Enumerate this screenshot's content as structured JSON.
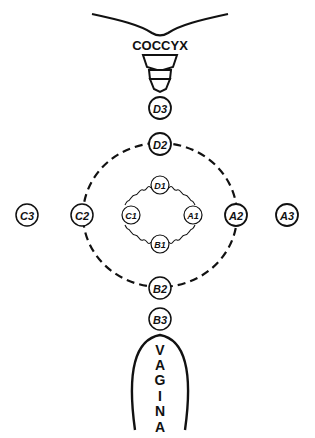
{
  "diagram": {
    "type": "anatomical-schematic",
    "colors": {
      "ink": "#111111",
      "background": "#ffffff"
    },
    "anatomy": {
      "top_label": "COCCYX",
      "bottom_label_letters": [
        "V",
        "A",
        "G",
        "I",
        "N",
        "A"
      ]
    },
    "nodes": [
      {
        "id": "D3",
        "label": "D3",
        "x": 160,
        "y": 108,
        "ring": 3
      },
      {
        "id": "D2",
        "label": "D2",
        "x": 160,
        "y": 144,
        "ring": 2
      },
      {
        "id": "D1",
        "label": "D1",
        "x": 160,
        "y": 185,
        "ring": 1
      },
      {
        "id": "C1",
        "label": "C1",
        "x": 131,
        "y": 215,
        "ring": 1
      },
      {
        "id": "A1",
        "label": "A1",
        "x": 193,
        "y": 215,
        "ring": 1
      },
      {
        "id": "B1",
        "label": "B1",
        "x": 160,
        "y": 244,
        "ring": 1
      },
      {
        "id": "C2",
        "label": "C2",
        "x": 82,
        "y": 215,
        "ring": 2
      },
      {
        "id": "A2",
        "label": "A2",
        "x": 236,
        "y": 215,
        "ring": 2
      },
      {
        "id": "C3",
        "label": "C3",
        "x": 27,
        "y": 215,
        "ring": 3
      },
      {
        "id": "A3",
        "label": "A3",
        "x": 287,
        "y": 215,
        "ring": 3
      },
      {
        "id": "B2",
        "label": "B2",
        "x": 160,
        "y": 288,
        "ring": 2
      },
      {
        "id": "B3",
        "label": "B3",
        "x": 160,
        "y": 319,
        "ring": 3
      }
    ],
    "connections": {
      "outer_ring": {
        "style": "dashed",
        "nodes": [
          "D2",
          "A2",
          "B2",
          "C2"
        ]
      },
      "inner_ring": {
        "style": "wavy",
        "nodes": [
          "D1",
          "A1",
          "B1",
          "C1"
        ]
      }
    }
  }
}
